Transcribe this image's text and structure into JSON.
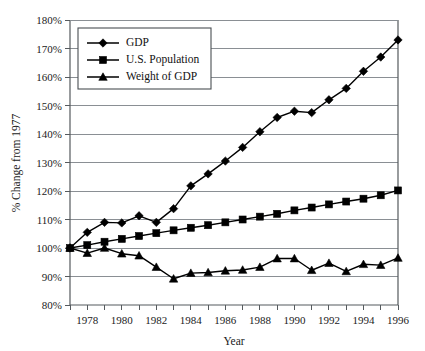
{
  "chart_data": {
    "type": "line",
    "title": "",
    "xlabel": "Year",
    "ylabel": "% Change from 1977",
    "xlim": [
      1977,
      1996
    ],
    "ylim": [
      80,
      180
    ],
    "ytick_suffix": "%",
    "grid": true,
    "legend_position": "top-left-inside",
    "x": [
      1977,
      1978,
      1979,
      1980,
      1981,
      1982,
      1983,
      1984,
      1985,
      1986,
      1987,
      1988,
      1989,
      1990,
      1991,
      1992,
      1993,
      1994,
      1995,
      1996
    ],
    "xticks": [
      1978,
      1980,
      1982,
      1984,
      1986,
      1988,
      1990,
      1992,
      1994,
      1996
    ],
    "xticks_labels": [
      "1978",
      "1980",
      "1982",
      "1984",
      "1986",
      "1988",
      "1990",
      "1992",
      "1994",
      "1996"
    ],
    "yticks": [
      80,
      90,
      100,
      110,
      120,
      130,
      140,
      150,
      160,
      170,
      180
    ],
    "yticks_labels": [
      "80%",
      "90%",
      "100%",
      "110%",
      "120%",
      "130%",
      "140%",
      "150%",
      "160%",
      "170%",
      "180%"
    ],
    "series": [
      {
        "name": "GDP",
        "marker": "diamond",
        "values": [
          100.0,
          105.5,
          109.0,
          108.8,
          111.3,
          109.0,
          113.8,
          121.8,
          126.0,
          130.5,
          135.3,
          140.8,
          145.8,
          148.0,
          147.5,
          152.0,
          156.0,
          162.0,
          167.0,
          173.0
        ]
      },
      {
        "name": "U.S. Population",
        "marker": "square",
        "values": [
          100.0,
          101.0,
          102.2,
          103.2,
          104.2,
          105.2,
          106.2,
          107.1,
          108.0,
          109.0,
          110.0,
          111.0,
          112.0,
          113.2,
          114.2,
          115.3,
          116.3,
          117.3,
          118.5,
          120.2
        ]
      },
      {
        "name": "Weight of GDP",
        "marker": "triangle",
        "values": [
          100.0,
          98.2,
          100.0,
          98.0,
          97.3,
          93.3,
          89.2,
          91.2,
          91.4,
          92.0,
          92.3,
          93.3,
          96.3,
          96.3,
          92.2,
          94.7,
          91.8,
          94.3,
          94.0,
          96.5
        ]
      }
    ]
  },
  "legend": {
    "items": [
      {
        "label": "GDP",
        "marker": "diamond"
      },
      {
        "label": "U.S. Population",
        "marker": "square"
      },
      {
        "label": "Weight of GDP",
        "marker": "triangle"
      }
    ]
  }
}
